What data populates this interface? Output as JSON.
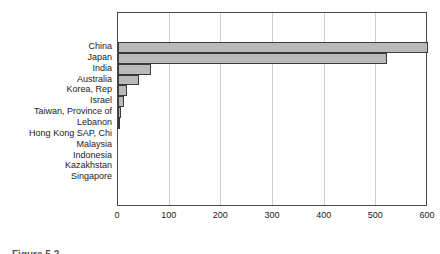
{
  "caption": "Figure 5.2",
  "colors": {
    "bar_fill": "#b9b9b9",
    "bar_border": "#3a3a3a",
    "gridline": "#cccccc",
    "frame": "#4a4a4a",
    "text": "#1a1a1a"
  },
  "chart_data": {
    "type": "bar",
    "orientation": "horizontal",
    "title": "",
    "xlabel": "",
    "ylabel": "",
    "categories": [
      "China",
      "Japan",
      "India",
      "Australia",
      "Korea, Rep",
      "Israel",
      "Taiwan, Province of",
      "Lebanon",
      "Hong Kong SAP, Chi",
      "Malaysia",
      "Indonesia",
      "Kazakhstan",
      "Singapore"
    ],
    "values": [
      600,
      520,
      64,
      41,
      17,
      12,
      6,
      3,
      1,
      1,
      1,
      1,
      0.5
    ],
    "xlim": [
      0,
      600
    ],
    "xticks": [
      0,
      100,
      200,
      300,
      400,
      500,
      600
    ],
    "grid": "vertical gridlines at each x tick",
    "legend": "none"
  }
}
